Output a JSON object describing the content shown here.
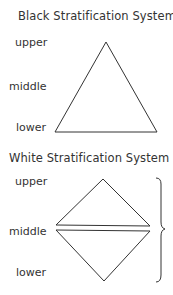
{
  "diagrams": [
    {
      "title": "Black Stratification System",
      "labels": [
        "upper",
        "middle",
        "lower"
      ],
      "shape": "triangle"
    },
    {
      "title": "White Stratification System",
      "labels": [
        "upper",
        "middle",
        "lower"
      ],
      "shape": "split-diamond-with-brace"
    }
  ],
  "colors": {
    "line": "#333333",
    "text": "#333333",
    "background": "#ffffff"
  }
}
